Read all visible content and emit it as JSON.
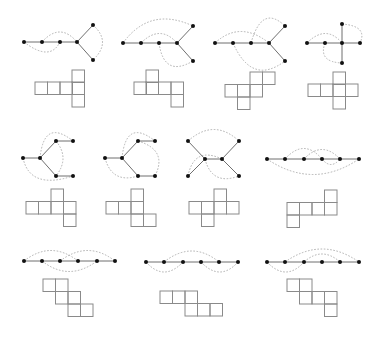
{
  "figure": {
    "colors": {
      "edge": "#6f6f6f",
      "arc": "#a8a8a8",
      "node": "#111111",
      "net": "#8a8a8a",
      "background": "#ffffff"
    },
    "square_size": 12.5,
    "panels": [
      {
        "id": 1,
        "nodes": [
          [
            24,
            42
          ],
          [
            42,
            42
          ],
          [
            60,
            42
          ],
          [
            77,
            42
          ],
          [
            93,
            25
          ],
          [
            93,
            60
          ]
        ],
        "edges": [
          [
            0,
            1
          ],
          [
            1,
            2
          ],
          [
            2,
            3
          ],
          [
            3,
            4
          ],
          [
            3,
            5
          ]
        ],
        "arcs": [
          {
            "d": "M24,42 Q50,62 60,42"
          },
          {
            "d": "M42,42 Q60,22 77,42"
          },
          {
            "d": "M93,25 Q112,42 93,60"
          }
        ],
        "net": [
          [
            72,
            70
          ],
          [
            35,
            82
          ],
          [
            47.5,
            82
          ],
          [
            60,
            82
          ],
          [
            72,
            82
          ],
          [
            72,
            94.5
          ]
        ]
      },
      {
        "id": 2,
        "nodes": [
          [
            123,
            43
          ],
          [
            141,
            43
          ],
          [
            159,
            43
          ],
          [
            177,
            43
          ],
          [
            193,
            26
          ],
          [
            193,
            61
          ]
        ],
        "edges": [
          [
            0,
            1
          ],
          [
            1,
            2
          ],
          [
            2,
            3
          ],
          [
            3,
            4
          ],
          [
            3,
            5
          ]
        ],
        "arcs": [
          {
            "d": "M123,43 Q150,6 193,26"
          },
          {
            "d": "M141,43 Q160,24 177,43"
          },
          {
            "d": "M159,43 Q164,78 193,61"
          }
        ],
        "net": [
          [
            146,
            70
          ],
          [
            134,
            82
          ],
          [
            146,
            82
          ],
          [
            158.5,
            82
          ],
          [
            171,
            82
          ],
          [
            171,
            94.5
          ]
        ]
      },
      {
        "id": 3,
        "nodes": [
          [
            215,
            43
          ],
          [
            233,
            43
          ],
          [
            251,
            43
          ],
          [
            269,
            43
          ],
          [
            285,
            26
          ],
          [
            285,
            61
          ]
        ],
        "edges": [
          [
            0,
            1
          ],
          [
            1,
            2
          ],
          [
            2,
            3
          ],
          [
            3,
            4
          ],
          [
            3,
            5
          ]
        ],
        "arcs": [
          {
            "d": "M215,43 Q240,20 269,43"
          },
          {
            "d": "M251,43 Q262,4 285,26"
          },
          {
            "d": "M233,43 Q252,86 285,61"
          }
        ],
        "net": [
          [
            250,
            72
          ],
          [
            262.5,
            72
          ],
          [
            225,
            84.5
          ],
          [
            237.5,
            84.5
          ],
          [
            250,
            84.5
          ],
          [
            237.5,
            97
          ]
        ]
      },
      {
        "id": 4,
        "nodes": [
          [
            307,
            43
          ],
          [
            325,
            43
          ],
          [
            342,
            43
          ],
          [
            360,
            43
          ],
          [
            342,
            24
          ],
          [
            342,
            63
          ]
        ],
        "edges": [
          [
            0,
            1
          ],
          [
            1,
            2
          ],
          [
            2,
            3
          ],
          [
            2,
            4
          ],
          [
            2,
            5
          ]
        ],
        "arcs": [
          {
            "d": "M307,43 Q326,24 342,43"
          },
          {
            "d": "M342,24 Q368,26 360,43"
          },
          {
            "d": "M325,43 Q318,62 342,63"
          }
        ],
        "net": [
          [
            333,
            72
          ],
          [
            308,
            84
          ],
          [
            320.5,
            84
          ],
          [
            333,
            84
          ],
          [
            345.5,
            84
          ],
          [
            333,
            96.5
          ]
        ]
      },
      {
        "id": 5,
        "nodes": [
          [
            23,
            158
          ],
          [
            40,
            158
          ],
          [
            56,
            141
          ],
          [
            73,
            141
          ],
          [
            56,
            176
          ],
          [
            73,
            176
          ]
        ],
        "edges": [
          [
            0,
            1
          ],
          [
            1,
            2
          ],
          [
            2,
            3
          ],
          [
            1,
            4
          ],
          [
            4,
            5
          ]
        ],
        "arcs": [
          {
            "d": "M40,158 Q44,118 73,141"
          },
          {
            "d": "M56,141 Q70,158 56,176"
          },
          {
            "d": "M23,158 Q30,190 73,176"
          }
        ],
        "net": [
          [
            51,
            189
          ],
          [
            26,
            201.5
          ],
          [
            38.5,
            201.5
          ],
          [
            51,
            201.5
          ],
          [
            63.5,
            201.5
          ],
          [
            63.5,
            214
          ]
        ]
      },
      {
        "id": 6,
        "nodes": [
          [
            105,
            158
          ],
          [
            122,
            158
          ],
          [
            138,
            141
          ],
          [
            155,
            141
          ],
          [
            138,
            176
          ],
          [
            155,
            176
          ]
        ],
        "edges": [
          [
            0,
            1
          ],
          [
            1,
            2
          ],
          [
            2,
            3
          ],
          [
            1,
            4
          ],
          [
            4,
            5
          ]
        ],
        "arcs": [
          {
            "d": "M122,158 Q126,118 155,141"
          },
          {
            "d": "M138,141 Q168,150 155,176"
          },
          {
            "d": "M105,158 Q112,184 138,176"
          }
        ],
        "net": [
          [
            131,
            189
          ],
          [
            106,
            201.5
          ],
          [
            118.5,
            201.5
          ],
          [
            131,
            201.5
          ],
          [
            131,
            214
          ],
          [
            143.5,
            214
          ]
        ]
      },
      {
        "id": 7,
        "nodes": [
          [
            188,
            141
          ],
          [
            188,
            176
          ],
          [
            205,
            159
          ],
          [
            222,
            159
          ],
          [
            239,
            141
          ],
          [
            239,
            176
          ]
        ],
        "edges": [
          [
            0,
            2
          ],
          [
            1,
            2
          ],
          [
            2,
            3
          ],
          [
            3,
            4
          ],
          [
            3,
            5
          ]
        ],
        "arcs": [
          {
            "d": "M188,141 Q214,118 239,141"
          },
          {
            "d": "M188,176 Q194,146 222,159"
          },
          {
            "d": "M205,159 Q212,186 239,176"
          }
        ],
        "net": [
          [
            214,
            189
          ],
          [
            189,
            201.5
          ],
          [
            201.5,
            201.5
          ],
          [
            214,
            201.5
          ],
          [
            226.5,
            201.5
          ],
          [
            201.5,
            214
          ]
        ]
      },
      {
        "id": 8,
        "nodes": [
          [
            267,
            159
          ],
          [
            285,
            159
          ],
          [
            304,
            159
          ],
          [
            322,
            159
          ],
          [
            340,
            159
          ],
          [
            359,
            159
          ]
        ],
        "edges": [
          [
            0,
            1
          ],
          [
            1,
            2
          ],
          [
            2,
            3
          ],
          [
            3,
            4
          ],
          [
            4,
            5
          ]
        ],
        "arcs": [
          {
            "d": "M285,159 Q304,138 322,159"
          },
          {
            "d": "M304,159 Q322,140 340,159"
          },
          {
            "d": "M267,159 Q313,190 359,159"
          },
          {
            "d": "M322,159 Q331,170 340,159"
          }
        ],
        "net": [
          [
            324.5,
            190
          ],
          [
            287,
            202.5
          ],
          [
            299.5,
            202.5
          ],
          [
            312,
            202.5
          ],
          [
            324.5,
            202.5
          ],
          [
            287,
            215
          ]
        ]
      },
      {
        "id": 9,
        "nodes": [
          [
            24,
            261
          ],
          [
            42,
            261
          ],
          [
            60,
            261
          ],
          [
            78,
            261
          ],
          [
            97,
            261
          ],
          [
            115,
            261
          ]
        ],
        "edges": [
          [
            0,
            1
          ],
          [
            1,
            2
          ],
          [
            2,
            3
          ],
          [
            3,
            4
          ],
          [
            4,
            5
          ]
        ],
        "arcs": [
          {
            "d": "M24,261 Q51,240 78,261"
          },
          {
            "d": "M60,261 Q88,240 115,261"
          },
          {
            "d": "M42,261 Q69,282 97,261"
          }
        ],
        "net": [
          [
            43,
            279
          ],
          [
            55.5,
            279
          ],
          [
            55.5,
            291.5
          ],
          [
            68,
            291.5
          ],
          [
            68,
            304
          ],
          [
            80.5,
            304
          ]
        ]
      },
      {
        "id": 10,
        "nodes": [
          [
            146,
            262
          ],
          [
            164,
            262
          ],
          [
            183,
            262
          ],
          [
            201,
            262
          ],
          [
            219,
            262
          ],
          [
            238,
            262
          ]
        ],
        "edges": [
          [
            0,
            1
          ],
          [
            1,
            2
          ],
          [
            2,
            3
          ],
          [
            3,
            4
          ],
          [
            4,
            5
          ]
        ],
        "arcs": [
          {
            "d": "M164,262 Q192,240 219,262"
          },
          {
            "d": "M146,262 Q164,282 183,262"
          },
          {
            "d": "M201,262 Q220,282 238,262"
          }
        ],
        "net": [
          [
            160,
            291
          ],
          [
            172.5,
            291
          ],
          [
            185,
            291
          ],
          [
            185,
            303.5
          ],
          [
            197.5,
            303.5
          ],
          [
            210,
            303.5
          ]
        ]
      },
      {
        "id": 11,
        "nodes": [
          [
            267,
            262
          ],
          [
            285,
            262
          ],
          [
            304,
            262
          ],
          [
            322,
            262
          ],
          [
            340,
            262
          ],
          [
            359,
            262
          ]
        ],
        "edges": [
          [
            0,
            1
          ],
          [
            1,
            2
          ],
          [
            2,
            3
          ],
          [
            3,
            4
          ],
          [
            4,
            5
          ]
        ],
        "arcs": [
          {
            "d": "M285,262 Q322,236 359,262"
          },
          {
            "d": "M304,262 Q322,246 340,262"
          },
          {
            "d": "M267,262 Q286,282 304,262"
          }
        ],
        "net": [
          [
            287,
            279
          ],
          [
            299.5,
            279
          ],
          [
            299.5,
            291.5
          ],
          [
            312,
            291.5
          ],
          [
            324.5,
            291.5
          ],
          [
            324.5,
            304
          ]
        ]
      }
    ]
  }
}
